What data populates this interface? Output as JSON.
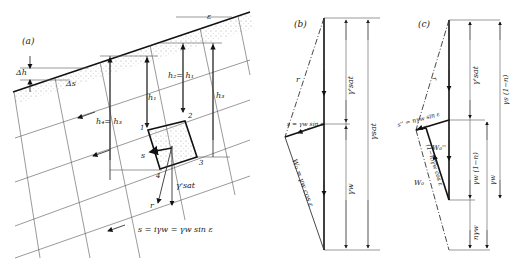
{
  "figure": {
    "panels": [
      {
        "id": "a",
        "label": "(a)",
        "annotations": {
          "delta_h": "Δh",
          "delta_s": "Δs",
          "epsilon": "ε",
          "h2_eq_h1": "h₂= h₁",
          "h1": "h₁",
          "h3": "h₃",
          "h4_eq_h3": "h₄= h₃",
          "corner_1": "1",
          "corner_2": "2",
          "corner_3": "3",
          "corner_4": "4",
          "s": "s",
          "r": "r",
          "gamma_sat_prime": "γ'sat",
          "formula": "s = iγw = γw sin ε"
        }
      },
      {
        "id": "b",
        "label": "(b)",
        "annotations": {
          "r": "r",
          "s_formula": "s = γw sin ε",
          "w0_formula": "W₀ = γw cos ε",
          "gamma_sat_prime": "γ'sat",
          "gamma_sat": "γsat",
          "gamma_w": "γw"
        }
      },
      {
        "id": "c",
        "label": "(c)",
        "annotations": {
          "r": "r",
          "s_formula": "s'' = nγw sin ε",
          "w0_double_prime": "W₀''",
          "w0_mid": "(1−n)γw cos ε",
          "w0": "W₀",
          "gamma_sat_prime": "γ'sat",
          "gamma_s_1_minus_n": "γs (1−n)",
          "gamma_w_1_minus_n": "γw (1−n)",
          "gamma_w": "γw",
          "n_gamma_w": "nγw"
        }
      }
    ]
  }
}
